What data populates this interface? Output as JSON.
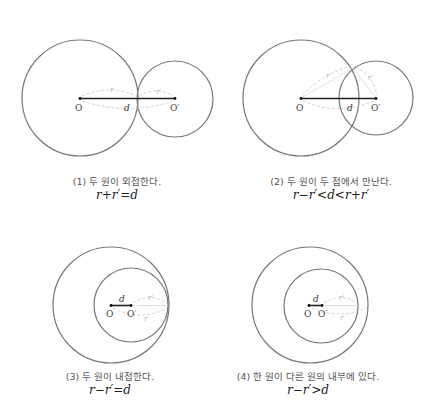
{
  "colors": {
    "circle_stroke": "#777777",
    "segment": "#222222",
    "dashed": "#cccccc",
    "caption_text": "#555555"
  },
  "labels": {
    "O": "O",
    "O_prime": "O′",
    "d": "d",
    "r": "r",
    "r_prime": "r′"
  },
  "panels": [
    {
      "id": 1,
      "caption": "(1) 두 원이 외접한다.",
      "formula": "r+r′=d",
      "big_circle": {
        "cx": 80,
        "cy": 98,
        "r": 58
      },
      "small_circle": {
        "cx": 175,
        "cy": 99,
        "r": 38
      }
    },
    {
      "id": 2,
      "caption": "(2) 두 원이 두 점에서 만난다.",
      "formula": "r−r′<d<r+r′",
      "big_circle": {
        "cx": 301,
        "cy": 98,
        "r": 58
      },
      "small_circle": {
        "cx": 376,
        "cy": 98,
        "r": 37
      }
    },
    {
      "id": 3,
      "caption": "(3) 두 원이 내접한다.",
      "formula": "r−r′=d",
      "big_circle": {
        "cx": 111,
        "cy": 305,
        "r": 58
      },
      "small_circle": {
        "cx": 131,
        "cy": 305,
        "r": 37
      }
    },
    {
      "id": 4,
      "caption": "(4) 한 원이 다른 원의 내부에 있다.",
      "formula": "r−r′>d",
      "big_circle": {
        "cx": 310,
        "cy": 305,
        "r": 58
      },
      "small_circle": {
        "cx": 321,
        "cy": 306,
        "r": 37
      }
    }
  ]
}
